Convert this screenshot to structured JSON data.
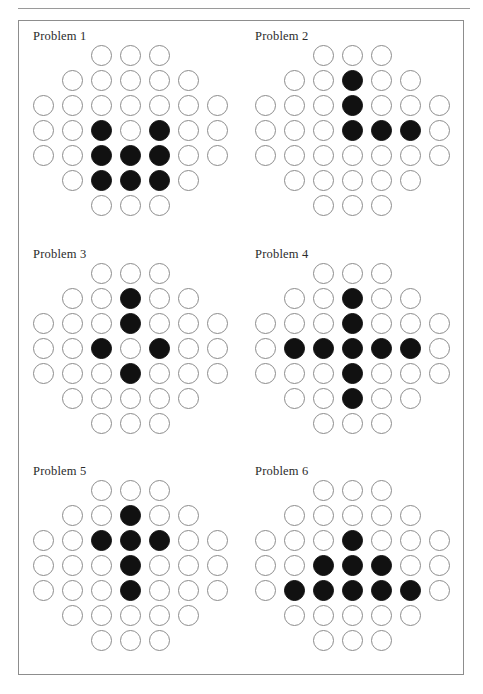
{
  "page": {
    "background_color": "#ffffff",
    "frame_border_color": "#8d8d8d",
    "rule_color": "#9a9a9a"
  },
  "legend": {
    "peg_color": "#111111",
    "hole_outline_color": "#8c8c8c",
    "peg_symbol": "filled-circle",
    "hole_symbol": "open-circle"
  },
  "board_layout": {
    "type": "peg-solitaire-diamond",
    "row_widths": [
      3,
      5,
      7,
      7,
      7,
      5,
      3
    ],
    "columns": 7,
    "rows": 7
  },
  "problems": [
    {
      "label": "Problem 1",
      "grid": [
        [
          0,
          0,
          1,
          1,
          1,
          0,
          0
        ],
        [
          0,
          1,
          1,
          1,
          1,
          1,
          0
        ],
        [
          1,
          1,
          1,
          1,
          1,
          1,
          1
        ],
        [
          1,
          1,
          2,
          1,
          2,
          1,
          1
        ],
        [
          1,
          1,
          2,
          2,
          2,
          1,
          1
        ],
        [
          0,
          1,
          2,
          2,
          2,
          1,
          0
        ],
        [
          0,
          0,
          1,
          1,
          1,
          0,
          0
        ]
      ],
      "peg_count": 8
    },
    {
      "label": "Problem 2",
      "grid": [
        [
          0,
          0,
          1,
          1,
          1,
          0,
          0
        ],
        [
          0,
          1,
          1,
          2,
          1,
          1,
          0
        ],
        [
          1,
          1,
          1,
          2,
          1,
          1,
          1
        ],
        [
          1,
          1,
          1,
          2,
          2,
          2,
          1
        ],
        [
          1,
          1,
          1,
          1,
          1,
          1,
          1
        ],
        [
          0,
          1,
          1,
          1,
          1,
          1,
          0
        ],
        [
          0,
          0,
          1,
          1,
          1,
          0,
          0
        ]
      ],
      "peg_count": 5
    },
    {
      "label": "Problem 3",
      "grid": [
        [
          0,
          0,
          1,
          1,
          1,
          0,
          0
        ],
        [
          0,
          1,
          1,
          2,
          1,
          1,
          0
        ],
        [
          1,
          1,
          1,
          2,
          1,
          1,
          1
        ],
        [
          1,
          1,
          2,
          1,
          2,
          1,
          1
        ],
        [
          1,
          1,
          1,
          2,
          1,
          1,
          1
        ],
        [
          0,
          1,
          1,
          1,
          1,
          1,
          0
        ],
        [
          0,
          0,
          1,
          1,
          1,
          0,
          0
        ]
      ],
      "peg_count": 5
    },
    {
      "label": "Problem 4",
      "grid": [
        [
          0,
          0,
          1,
          1,
          1,
          0,
          0
        ],
        [
          0,
          1,
          1,
          2,
          1,
          1,
          0
        ],
        [
          1,
          1,
          1,
          2,
          1,
          1,
          1
        ],
        [
          1,
          2,
          2,
          2,
          2,
          2,
          1
        ],
        [
          1,
          1,
          1,
          2,
          1,
          1,
          1
        ],
        [
          0,
          1,
          1,
          2,
          1,
          1,
          0
        ],
        [
          0,
          0,
          1,
          1,
          1,
          0,
          0
        ]
      ],
      "peg_count": 9
    },
    {
      "label": "Problem 5",
      "grid": [
        [
          0,
          0,
          1,
          1,
          1,
          0,
          0
        ],
        [
          0,
          1,
          1,
          2,
          1,
          1,
          0
        ],
        [
          1,
          1,
          2,
          2,
          2,
          1,
          1
        ],
        [
          1,
          1,
          1,
          2,
          1,
          1,
          1
        ],
        [
          1,
          1,
          1,
          2,
          1,
          1,
          1
        ],
        [
          0,
          1,
          1,
          1,
          1,
          1,
          0
        ],
        [
          0,
          0,
          1,
          1,
          1,
          0,
          0
        ]
      ],
      "peg_count": 6
    },
    {
      "label": "Problem 6",
      "grid": [
        [
          0,
          0,
          1,
          1,
          1,
          0,
          0
        ],
        [
          0,
          1,
          1,
          1,
          1,
          1,
          0
        ],
        [
          1,
          1,
          1,
          2,
          1,
          1,
          1
        ],
        [
          1,
          1,
          2,
          2,
          2,
          1,
          1
        ],
        [
          1,
          2,
          2,
          2,
          2,
          2,
          1
        ],
        [
          0,
          1,
          1,
          1,
          1,
          1,
          0
        ],
        [
          0,
          0,
          1,
          1,
          1,
          0,
          0
        ]
      ],
      "peg_count": 9
    }
  ]
}
